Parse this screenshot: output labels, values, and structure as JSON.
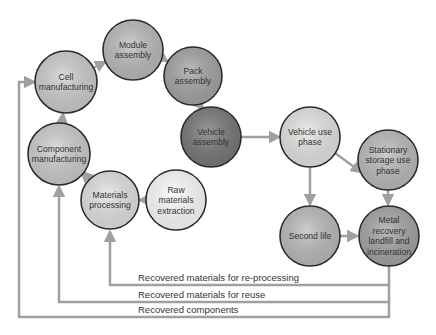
{
  "diagram": {
    "nodes": [
      {
        "id": "cell",
        "lines": [
          "Cell",
          "manufacturing"
        ],
        "cx": 66,
        "cy": 82,
        "r": 31,
        "fill": "#cfcfcf"
      },
      {
        "id": "module",
        "lines": [
          "Module",
          "assembly"
        ],
        "cx": 133,
        "cy": 50,
        "r": 30,
        "fill": "#bdbdbd"
      },
      {
        "id": "pack",
        "lines": [
          "Pack",
          "assembly"
        ],
        "cx": 193,
        "cy": 76,
        "r": 29,
        "fill": "#a6a6a6"
      },
      {
        "id": "vehicle-assembly",
        "lines": [
          "Vehicle",
          "assembly"
        ],
        "cx": 211,
        "cy": 137,
        "r": 30,
        "fill": "#7a7a7a"
      },
      {
        "id": "component",
        "lines": [
          "Component",
          "manufacturing"
        ],
        "cx": 59,
        "cy": 154,
        "r": 31,
        "fill": "#cfcfcf"
      },
      {
        "id": "materials-processing",
        "lines": [
          "Materials",
          "processing"
        ],
        "cx": 110,
        "cy": 200,
        "r": 29,
        "fill": "#e4e4e4"
      },
      {
        "id": "raw-materials",
        "lines": [
          "Raw",
          "materials",
          "extraction"
        ],
        "cx": 176,
        "cy": 200,
        "r": 30,
        "fill": "#ffffff"
      },
      {
        "id": "vehicle-use",
        "lines": [
          "Vehicle use",
          "phase"
        ],
        "cx": 310,
        "cy": 137,
        "r": 30,
        "fill": "#e6e6e6"
      },
      {
        "id": "stationary",
        "lines": [
          "Stationary",
          "storage use",
          "phase"
        ],
        "cx": 388,
        "cy": 160,
        "r": 30,
        "fill": "#bdbdbd"
      },
      {
        "id": "second-life",
        "lines": [
          "Second life"
        ],
        "cx": 310,
        "cy": 236,
        "r": 30,
        "fill": "#bdbdbd"
      },
      {
        "id": "metal-recovery",
        "lines": [
          "Metal",
          "recovery",
          "landfill and",
          "incineration"
        ],
        "cx": 389,
        "cy": 236,
        "r": 30,
        "fill": "#a6a6a6"
      }
    ],
    "labels": {
      "reprocessing": "Recovered materials for re-processing",
      "reuse": "Recovered materials for reuse",
      "components": "Recovered components"
    },
    "colors": {
      "arrow": "#a0a0a0",
      "stroke": "#2a2a2a",
      "text": "#333333"
    }
  }
}
